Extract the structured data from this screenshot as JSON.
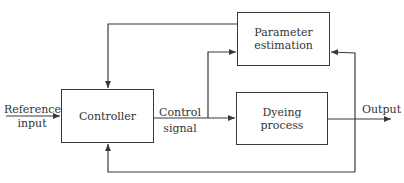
{
  "diagram": {
    "type": "block-diagram",
    "blocks": {
      "controller": {
        "label": "Controller"
      },
      "parameter_estimation": {
        "line1": "Parameter",
        "line2": "estimation"
      },
      "dyeing_process": {
        "line1": "Dyeing",
        "line2": "process"
      }
    },
    "labels": {
      "reference_input": {
        "line1": "Reference",
        "line2": "input"
      },
      "control_signal": {
        "line1": "Control",
        "line2": "signal"
      },
      "output": "Output"
    },
    "colors": {
      "stroke": "#3a3a3a",
      "text": "#333333",
      "background": "#ffffff"
    }
  }
}
